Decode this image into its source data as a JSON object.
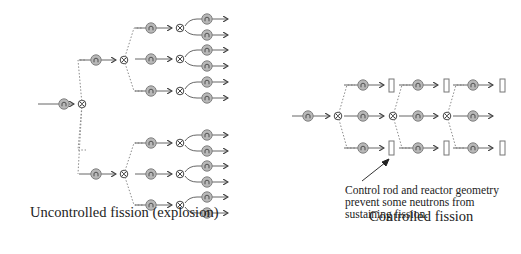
{
  "diagram": {
    "left": {
      "caption": "Uncontrolled fission (explosion)",
      "neutron_label": "n",
      "description": "Chain reaction: each fission (⊗) releases three neutrons, each causing further fission releasing two more neutrons"
    },
    "right": {
      "caption": "Controlled fission",
      "neutron_label": "n",
      "annotation": "Control rod and reactor geometry\nprevent some neutrons from\nsustaining fission."
    },
    "colors": {
      "neutron_fill": "#b8b8b8",
      "stroke": "#555555",
      "dashed": "#8a8a8a",
      "text": "#222222"
    },
    "icons": {
      "neutron": "circle-n-icon",
      "fission": "circled-times-icon",
      "absorber": "control-rod-rect-icon"
    }
  }
}
